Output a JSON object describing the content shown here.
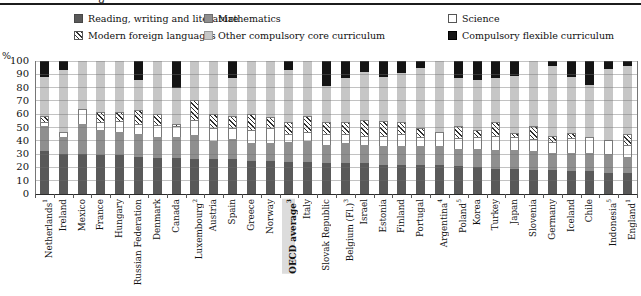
{
  "header": {
    "cropped_text": "g"
  },
  "axis": {
    "percent_label": "%"
  },
  "chart_data": {
    "type": "bar",
    "stacked": true,
    "title": "",
    "ylabel": "%",
    "ylim": [
      0,
      100
    ],
    "yticks": [
      0,
      10,
      20,
      30,
      40,
      50,
      60,
      70,
      80,
      90,
      100
    ],
    "grid": true,
    "legend_position": "top",
    "category_highlight": "OECD average",
    "legend": [
      {
        "key": "reading",
        "label": "Reading, writing and literature",
        "color": "#595959",
        "pattern": "solid"
      },
      {
        "key": "math",
        "label": "Mathematics",
        "color": "#8f8f8f",
        "pattern": "solid"
      },
      {
        "key": "science",
        "label": "Science",
        "color": "#ffffff",
        "pattern": "solid"
      },
      {
        "key": "mfl",
        "label": "Modern foreign languages",
        "color": "#ffffff",
        "pattern": "diagonal-hatch"
      },
      {
        "key": "other",
        "label": "Other compulsory core curriculum",
        "color": "#c6c6c6",
        "pattern": "solid"
      },
      {
        "key": "flexible",
        "label": "Compulsory flexible curriculum",
        "color": "#141414",
        "pattern": "solid"
      }
    ],
    "categories": [
      {
        "label": "Netherlands",
        "sup": "1"
      },
      {
        "label": "Ireland",
        "sup": ""
      },
      {
        "label": "Mexico",
        "sup": ""
      },
      {
        "label": "France",
        "sup": ""
      },
      {
        "label": "Hungary",
        "sup": ""
      },
      {
        "label": "Russian Federation",
        "sup": ""
      },
      {
        "label": "Denmark",
        "sup": ""
      },
      {
        "label": "Canada",
        "sup": ""
      },
      {
        "label": "Luxembourg",
        "sup": "2"
      },
      {
        "label": "Austria",
        "sup": ""
      },
      {
        "label": "Spain",
        "sup": ""
      },
      {
        "label": "Greece",
        "sup": ""
      },
      {
        "label": "Norway",
        "sup": ""
      },
      {
        "label": "OECD average",
        "sup": "3"
      },
      {
        "label": "Italy",
        "sup": ""
      },
      {
        "label": "Slovak Republic",
        "sup": ""
      },
      {
        "label": "Belgium (Fl.)",
        "sup": "3"
      },
      {
        "label": "Israel",
        "sup": ""
      },
      {
        "label": "Estonia",
        "sup": ""
      },
      {
        "label": "Finland",
        "sup": ""
      },
      {
        "label": "Portugal",
        "sup": ""
      },
      {
        "label": "Argentina",
        "sup": "4"
      },
      {
        "label": "Poland",
        "sup": "5"
      },
      {
        "label": "Korea",
        "sup": ""
      },
      {
        "label": "Turkey",
        "sup": ""
      },
      {
        "label": "Japan",
        "sup": ""
      },
      {
        "label": "Slovenia",
        "sup": ""
      },
      {
        "label": "Germany",
        "sup": ""
      },
      {
        "label": "Iceland",
        "sup": ""
      },
      {
        "label": "Chile",
        "sup": ""
      },
      {
        "label": "Indonesia",
        "sup": "5"
      },
      {
        "label": "England",
        "sup": "1"
      }
    ],
    "series": [
      {
        "name": "Reading, writing and literature",
        "values": [
          32,
          30,
          30,
          29,
          29,
          28,
          27,
          27,
          26,
          26,
          26,
          25,
          25,
          24,
          24,
          23,
          23,
          23,
          22,
          22,
          22,
          22,
          21,
          20,
          19,
          19,
          18,
          18,
          17,
          17,
          16,
          16
        ]
      },
      {
        "name": "Mathematics",
        "values": [
          19,
          13,
          23,
          19,
          18,
          17,
          16,
          16,
          18,
          14,
          15,
          13,
          13,
          15,
          16,
          14,
          15,
          14,
          14,
          14,
          14,
          14,
          13,
          14,
          14,
          14,
          14,
          13,
          14,
          14,
          14,
          12
        ]
      },
      {
        "name": "Science",
        "values": [
          3,
          4,
          11,
          6,
          8,
          8,
          9,
          8,
          12,
          10,
          9,
          10,
          12,
          6,
          7,
          8,
          7,
          7,
          8,
          9,
          7,
          11,
          8,
          9,
          11,
          10,
          9,
          8,
          11,
          12,
          11,
          9
        ]
      },
      {
        "name": "Modern foreign languages",
        "values": [
          5,
          0,
          0,
          8,
          7,
          10,
          8,
          2,
          15,
          10,
          9,
          12,
          8,
          9,
          12,
          9,
          9,
          12,
          11,
          9,
          7,
          0,
          9,
          5,
          10,
          3,
          10,
          5,
          4,
          0,
          0,
          8
        ]
      },
      {
        "name": "Other compulsory core curriculum",
        "values": [
          29,
          46,
          36,
          38,
          38,
          23,
          40,
          27,
          29,
          40,
          28,
          40,
          42,
          39,
          41,
          27,
          33,
          36,
          33,
          37,
          45,
          53,
          36,
          38,
          33,
          43,
          49,
          52,
          42,
          39,
          53,
          51
        ]
      },
      {
        "name": "Compulsory flexible curriculum",
        "values": [
          12,
          7,
          0,
          0,
          0,
          14,
          0,
          20,
          0,
          0,
          13,
          0,
          0,
          7,
          0,
          19,
          13,
          8,
          12,
          9,
          5,
          0,
          13,
          14,
          13,
          11,
          0,
          4,
          12,
          18,
          6,
          4
        ]
      }
    ]
  }
}
